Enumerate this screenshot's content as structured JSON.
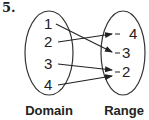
{
  "problem_number": "5.",
  "diagram": {
    "type": "mapping",
    "domain": {
      "label": "Domain",
      "values": [
        "1",
        "2",
        "3",
        "4"
      ]
    },
    "range": {
      "label": "Range",
      "values": [
        "4",
        "3",
        "2"
      ]
    },
    "mappings": [
      {
        "from": "1",
        "to": "3"
      },
      {
        "from": "2",
        "to": "4"
      },
      {
        "from": "3",
        "to": "2"
      },
      {
        "from": "4",
        "to": "2"
      }
    ],
    "line_color": "#222222"
  }
}
